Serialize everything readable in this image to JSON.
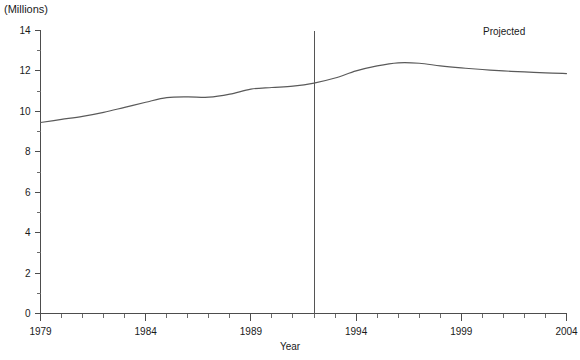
{
  "figure": {
    "units_label": "(Millions)",
    "projected_label": "Projected",
    "truncated_title": "",
    "line_color": "#5a5a5a",
    "axis_color": "#4d4d4d",
    "divider_color": "#555555",
    "background_color": "#ffffff"
  },
  "chart_data": {
    "type": "line",
    "title": "",
    "xlabel": "Year",
    "ylabel": "(Millions)",
    "xlim": [
      1979,
      2004
    ],
    "ylim": [
      0,
      14
    ],
    "grid": false,
    "legend": null,
    "y_ticks": [
      0,
      2,
      4,
      6,
      8,
      10,
      12,
      14
    ],
    "y_tick_labels": [
      "0",
      "2",
      "4",
      "6",
      "8",
      "10",
      "12",
      "14"
    ],
    "y_minor_ticks": [
      1,
      3,
      5,
      7,
      9,
      11,
      13
    ],
    "x_ticks": [
      1979,
      1984,
      1989,
      1994,
      1999,
      2004
    ],
    "x_tick_labels": [
      "1979",
      "1984",
      "1989",
      "1994",
      "1999",
      "2004"
    ],
    "x_minor_ticks": [
      1980,
      1981,
      1982,
      1983,
      1985,
      1986,
      1987,
      1988,
      1990,
      1991,
      1992,
      1993,
      1995,
      1996,
      1997,
      1998,
      2000,
      2001,
      2002,
      2003
    ],
    "annotations": [
      {
        "text": "Projected",
        "x": 2000.1,
        "y": 13.3
      },
      {
        "text": "(Millions)",
        "x": 1979,
        "y": 14.6
      }
    ],
    "vline": {
      "x": 1992,
      "label": "projection-start"
    },
    "x": [
      1979,
      1980,
      1981,
      1982,
      1983,
      1984,
      1985,
      1986,
      1987,
      1988,
      1989,
      1990,
      1991,
      1992,
      1993,
      1994,
      1995,
      1996,
      1997,
      1998,
      1999,
      2000,
      2001,
      2002,
      2003,
      2004
    ],
    "values": [
      9.45,
      9.6,
      9.75,
      9.95,
      10.2,
      10.45,
      10.68,
      10.72,
      10.7,
      10.85,
      11.1,
      11.18,
      11.25,
      11.4,
      11.65,
      12.0,
      12.25,
      12.4,
      12.38,
      12.25,
      12.15,
      12.07,
      12.0,
      11.95,
      11.9,
      11.87
    ],
    "series": [
      {
        "name": "Enrollment",
        "values": [
          9.45,
          9.6,
          9.75,
          9.95,
          10.2,
          10.45,
          10.68,
          10.72,
          10.7,
          10.85,
          11.1,
          11.18,
          11.25,
          11.4,
          11.65,
          12.0,
          12.25,
          12.4,
          12.38,
          12.25,
          12.15,
          12.07,
          12.0,
          11.95,
          11.9,
          11.87
        ]
      }
    ]
  }
}
